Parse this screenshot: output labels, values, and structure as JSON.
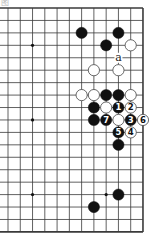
{
  "diagram": {
    "caption": "图",
    "type": "go-board-partial",
    "visible_columns": 12,
    "visible_rows": 19,
    "edges": {
      "top": true,
      "right": true,
      "bottom": true,
      "left": false
    },
    "colors": {
      "line": "#3a3a3a",
      "black_stone": "#111111",
      "white_stone": "#ffffff",
      "background": "#ffffff"
    },
    "star_points": [
      {
        "col": 2,
        "row": 3
      },
      {
        "col": 2,
        "row": 9
      },
      {
        "col": 2,
        "row": 15
      },
      {
        "col": 8,
        "row": 15
      }
    ],
    "stones": [
      {
        "color": "black",
        "col": 6,
        "row": 2,
        "label": ""
      },
      {
        "color": "black",
        "col": 9,
        "row": 2,
        "label": ""
      },
      {
        "color": "black",
        "col": 8,
        "row": 3,
        "label": ""
      },
      {
        "color": "white",
        "col": 10,
        "row": 3,
        "label": ""
      },
      {
        "color": "white",
        "col": 7,
        "row": 5,
        "label": ""
      },
      {
        "color": "white",
        "col": 9,
        "row": 5,
        "label": ""
      },
      {
        "color": "white",
        "col": 6,
        "row": 7,
        "label": ""
      },
      {
        "color": "white",
        "col": 7,
        "row": 7,
        "label": ""
      },
      {
        "color": "black",
        "col": 8,
        "row": 7,
        "label": ""
      },
      {
        "color": "black",
        "col": 9,
        "row": 7,
        "label": ""
      },
      {
        "color": "white",
        "col": 10,
        "row": 7,
        "label": ""
      },
      {
        "color": "black",
        "col": 7,
        "row": 8,
        "label": ""
      },
      {
        "color": "white",
        "col": 8,
        "row": 8,
        "label": ""
      },
      {
        "color": "black",
        "col": 9,
        "row": 8,
        "label": "1"
      },
      {
        "color": "white",
        "col": 10,
        "row": 8,
        "label": "2"
      },
      {
        "color": "black",
        "col": 7,
        "row": 9,
        "label": ""
      },
      {
        "color": "black",
        "col": 8,
        "row": 9,
        "label": "7"
      },
      {
        "color": "white",
        "col": 9,
        "row": 9,
        "label": ""
      },
      {
        "color": "black",
        "col": 10,
        "row": 9,
        "label": "3"
      },
      {
        "color": "white",
        "col": 11,
        "row": 9,
        "label": "6"
      },
      {
        "color": "black",
        "col": 9,
        "row": 10,
        "label": "5"
      },
      {
        "color": "white",
        "col": 10,
        "row": 10,
        "label": "4"
      },
      {
        "color": "black",
        "col": 9,
        "row": 11,
        "label": ""
      },
      {
        "color": "black",
        "col": 9,
        "row": 15,
        "label": ""
      },
      {
        "color": "black",
        "col": 7,
        "row": 16,
        "label": ""
      }
    ],
    "marks": [
      {
        "text": "a",
        "col": 9,
        "row": 4
      }
    ]
  }
}
